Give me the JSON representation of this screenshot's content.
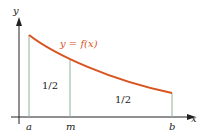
{
  "diagram": {
    "axes": {
      "x_label": "x",
      "y_label": "y"
    },
    "curve": {
      "label": "y = f(x)",
      "color": "#d9531e"
    },
    "points": {
      "a": "a",
      "m": "m",
      "b": "b"
    },
    "regions": [
      {
        "label": "1/2"
      },
      {
        "label": "1/2"
      }
    ],
    "colors": {
      "axis": "#222222",
      "vertical_lines": "#8fb39a"
    }
  }
}
